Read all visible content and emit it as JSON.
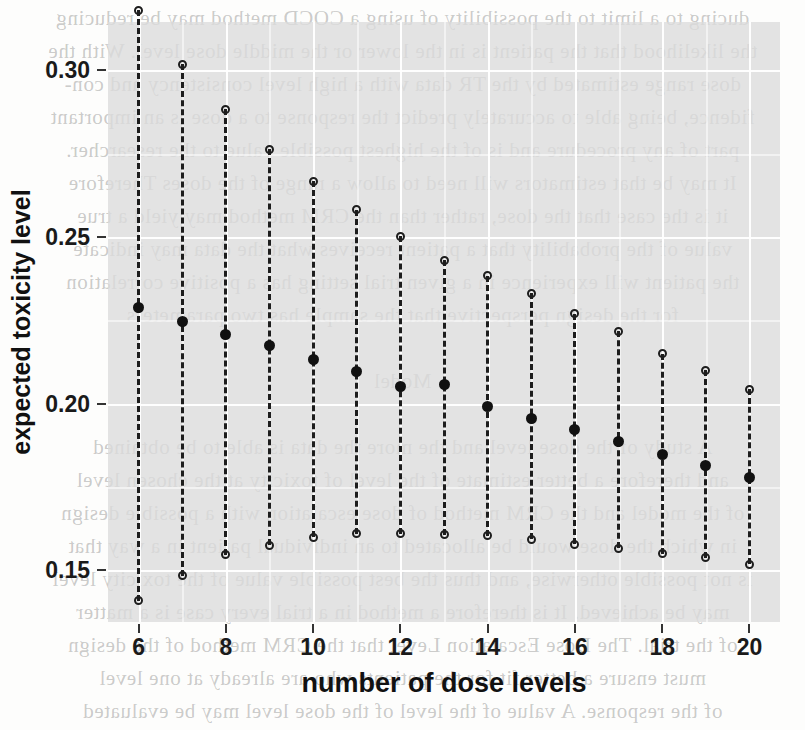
{
  "figure": {
    "y_axis_title": "expected toxicity level",
    "x_axis_title": "number of dose levels"
  },
  "chart_data": {
    "type": "scatter",
    "title": "",
    "subtitle": "",
    "xlabel": "number of dose levels",
    "ylabel": "expected toxicity level",
    "xlim": [
      5.3,
      20.7
    ],
    "ylim": [
      0.1345,
      0.3145
    ],
    "grid": true,
    "legend": null,
    "x_ticks": [
      6,
      8,
      10,
      12,
      14,
      16,
      18,
      20
    ],
    "x_tick_labels": [
      "6",
      "8",
      "10",
      "12",
      "14",
      "16",
      "18",
      "20"
    ],
    "y_ticks": [
      0.15,
      0.2,
      0.25,
      0.3
    ],
    "y_tick_labels": [
      "0.15",
      "0.20",
      "0.25",
      "0.30"
    ],
    "marker_styles": {
      "upper_bound": "open-circle",
      "lower_bound": "open-circle",
      "estimate": "filled-circle",
      "connector": "dashed-vertical-line"
    },
    "x": [
      6,
      7,
      8,
      9,
      10,
      11,
      12,
      13,
      14,
      15,
      16,
      17,
      18,
      19,
      20
    ],
    "series": [
      {
        "name": "upper bound",
        "values": [
          0.3181,
          0.3019,
          0.2884,
          0.2764,
          0.2667,
          0.2582,
          0.2503,
          0.2431,
          0.2384,
          0.2331,
          0.227,
          0.2217,
          0.215,
          0.2101,
          0.2044
        ]
      },
      {
        "name": "expected toxicity level",
        "values": [
          0.2289,
          0.2248,
          0.2209,
          0.2174,
          0.2132,
          0.2097,
          0.2053,
          0.2057,
          0.1993,
          0.1955,
          0.1924,
          0.1887,
          0.1849,
          0.1815,
          0.178
        ]
      },
      {
        "name": "lower bound",
        "values": [
          0.1409,
          0.1484,
          0.1547,
          0.1575,
          0.16,
          0.161,
          0.161,
          0.1607,
          0.1604,
          0.1594,
          0.1578,
          0.1566,
          0.155,
          0.1538,
          0.1519
        ]
      }
    ]
  },
  "background_text": {
    "lines": [
      "ducing to a limit to the  possibility of using a COCD method may be reducing",
      "the likelihood that the patient is in the lower or the middle dose  level.  With the",
      "dose range estimated by the TR data with a high level consistency and con-",
      "fidence, being able to  accurately  predict  the  response to a  dose is an important",
      "part of any procedure and is of the highest possible value to the researcher.",
      "It may be  that estimators  will  need to allow a  range of the doses   Therefore",
      "it is the case that  the dose, rather  than  the  CRM  method  may  yield a true",
      "value of the  probability  that  a  patient receives what the  data  may  indicate",
      "the patient will  experience  in  a  given  trial  setting  has  a  positive  correlation",
      "for the  design perspective  that  the  sample  has  two  parameters",
      "",
      "                                                          Model",
      "",
      "A  study  of  the  dose  level  and  the  more  the   data   is  able  to  be  obtained",
      "and  therefore  a  better  estimate  of  the  level  of  toxicity  at  the  chosen  level",
      "of  the  model  and  the  CRM  method  of  dose  escalation  with  a  possible  design",
      "in  which  the  dose  would  be  allocated  to  an  individual  patient  in  a  way  that",
      "is  not  possible  otherwise,  and  thus  the  best  possible  value  of  the  toxicity  level",
      "may  be  achieved.  It  is  therefore  a  method  in  a  trial  every  case  is  a  matter",
      "of  the  trial.  The  Dose  Escalation  Level  that  the  CRM  method  of  the  design",
      "must  ensure  a  better  fit  for  the  patients  who  are  already  at  one  level",
      "of  the  response.  A  value  of  the  level  of  the  dose  level  may  be  evaluated"
    ]
  }
}
